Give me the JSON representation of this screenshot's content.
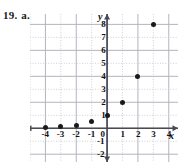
{
  "problem": {
    "number": "19.",
    "part": "a."
  },
  "chart_data": {
    "type": "scatter",
    "title": "",
    "xlabel": "x",
    "ylabel": "y",
    "xlim": [
      -5,
      4.6
    ],
    "ylim": [
      -2.6,
      8.8
    ],
    "grid": true,
    "grid_step": 1,
    "legend": null,
    "x": [
      -4,
      -3,
      -2,
      -1,
      0,
      1,
      2,
      3
    ],
    "values": [
      0.0625,
      0.125,
      0.25,
      0.5,
      1,
      2,
      4,
      8
    ],
    "points": [
      {
        "x": -4,
        "y": 0.0625
      },
      {
        "x": -3,
        "y": 0.125
      },
      {
        "x": -2,
        "y": 0.25
      },
      {
        "x": -1,
        "y": 0.5
      },
      {
        "x": 0,
        "y": 1
      },
      {
        "x": 1,
        "y": 2
      },
      {
        "x": 2,
        "y": 4
      },
      {
        "x": 3,
        "y": 8
      }
    ],
    "xticks": [
      -4,
      -3,
      -2,
      -1,
      0,
      1,
      2,
      3,
      4
    ],
    "xtick_labels": [
      "-4",
      "-3",
      "-2",
      "-1",
      "0",
      "1",
      "2",
      "3",
      "4"
    ],
    "yticks": [
      -2,
      -1,
      1,
      2,
      3,
      4,
      5,
      6,
      7,
      8
    ],
    "ytick_labels": [
      "-2",
      "-1",
      "1",
      "2",
      "3",
      "4",
      "5",
      "6",
      "7",
      "8"
    ]
  },
  "colors": {
    "point": "#1a1a1a",
    "axis": "#4a4a55",
    "grid_minor": "#cfcfd6",
    "grid_major": "#b4b4be",
    "text": "#111111"
  }
}
